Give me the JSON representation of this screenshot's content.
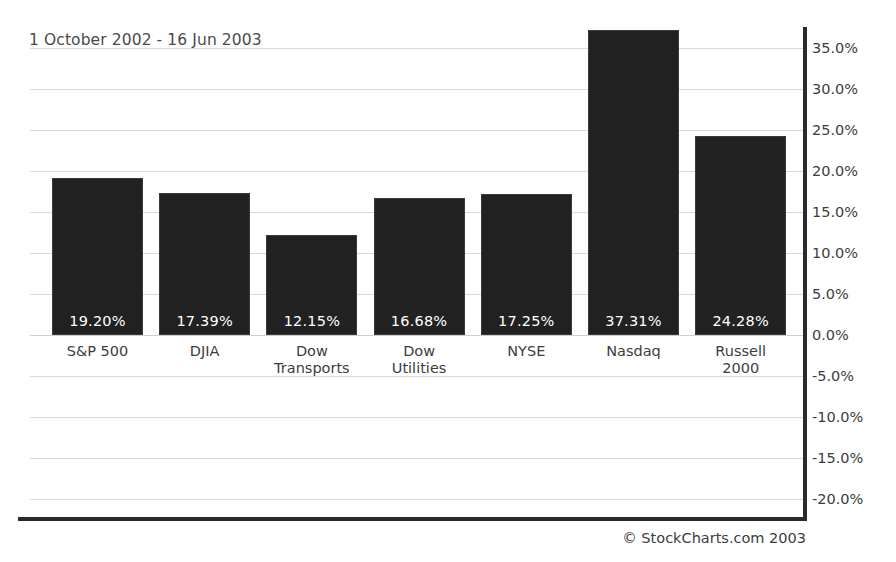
{
  "chart_data": {
    "type": "bar",
    "title": "1 October 2002 - 16 Jun 2003",
    "xlabel": "",
    "ylabel": "",
    "categories": [
      "S&P 500",
      "DJIA",
      "Dow\nTransports",
      "Dow\nUtilities",
      "NYSE",
      "Nasdaq",
      "Russell\n2000"
    ],
    "values": [
      19.2,
      17.39,
      12.15,
      16.68,
      17.25,
      37.31,
      24.28
    ],
    "value_labels": [
      "19.20%",
      "17.39%",
      "12.15%",
      "16.68%",
      "17.25%",
      "37.31%",
      "24.28%"
    ],
    "ylim": [
      -22.5,
      37.5
    ],
    "ytick_values": [
      35.0,
      30.0,
      25.0,
      20.0,
      15.0,
      10.0,
      5.0,
      0.0,
      -5.0,
      -10.0,
      -15.0,
      -20.0
    ],
    "ytick_labels": [
      "35.0%",
      "30.0%",
      "25.0%",
      "20.0%",
      "15.0%",
      "10.0%",
      "5.0%",
      "0.0%",
      "-5.0%",
      "-10.0%",
      "-15.0%",
      "-20.0%"
    ],
    "grid": true,
    "legend_position": "none",
    "series": [
      {
        "name": "Percent change",
        "values": [
          19.2,
          17.39,
          12.15,
          16.68,
          17.25,
          37.31,
          24.28
        ]
      }
    ],
    "bar_color": "#202020",
    "value_label_color": "#ffffff",
    "axis_color": "#2a2a2a",
    "gridline_color": "#d8d8d8"
  },
  "footer": {
    "copyright": "© StockCharts.com 2003"
  }
}
